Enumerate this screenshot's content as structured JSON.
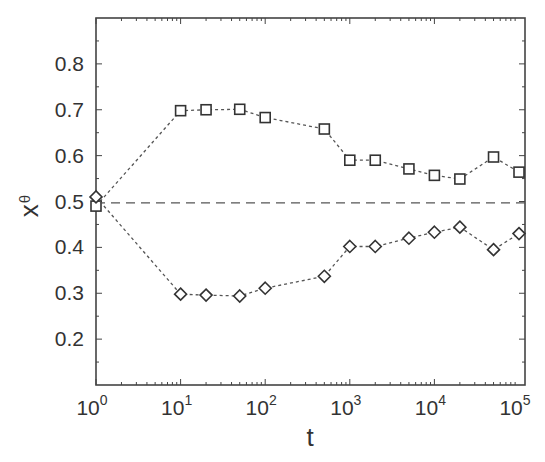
{
  "chart_data": {
    "type": "line",
    "title": "",
    "xlabel": "t",
    "ylabel": "x",
    "ylabel_subscript": "θ",
    "xscale": "log",
    "xlim": [
      1,
      100000
    ],
    "ylim": [
      0.1,
      0.9
    ],
    "grid": false,
    "legend": null,
    "x_ticks": [
      {
        "base": "10",
        "exp": "0",
        "value": 1
      },
      {
        "base": "10",
        "exp": "1",
        "value": 10
      },
      {
        "base": "10",
        "exp": "2",
        "value": 100
      },
      {
        "base": "10",
        "exp": "3",
        "value": 1000
      },
      {
        "base": "10",
        "exp": "4",
        "value": 10000
      },
      {
        "base": "10",
        "exp": "5",
        "value": 100000
      }
    ],
    "y_ticks": [
      "0.2",
      "0.3",
      "0.4",
      "0.5",
      "0.6",
      "0.7",
      "0.8"
    ],
    "x": [
      1,
      10,
      20,
      50,
      100,
      500,
      1000,
      2000,
      5000,
      10000,
      20000,
      50000,
      100000
    ],
    "series": [
      {
        "name": "squares",
        "marker": "square",
        "line": "dotted",
        "values": [
          0.49,
          0.698,
          0.7,
          0.701,
          0.683,
          0.658,
          0.59,
          0.59,
          0.571,
          0.557,
          0.549,
          0.597,
          0.564
        ]
      },
      {
        "name": "diamonds",
        "marker": "diamond",
        "line": "dotted",
        "values": [
          0.51,
          0.298,
          0.296,
          0.294,
          0.311,
          0.337,
          0.402,
          0.402,
          0.42,
          0.433,
          0.444,
          0.395,
          0.43
        ]
      }
    ],
    "reference_lines": [
      {
        "orientation": "horizontal",
        "y": 0.497,
        "style": "dashed"
      }
    ]
  }
}
